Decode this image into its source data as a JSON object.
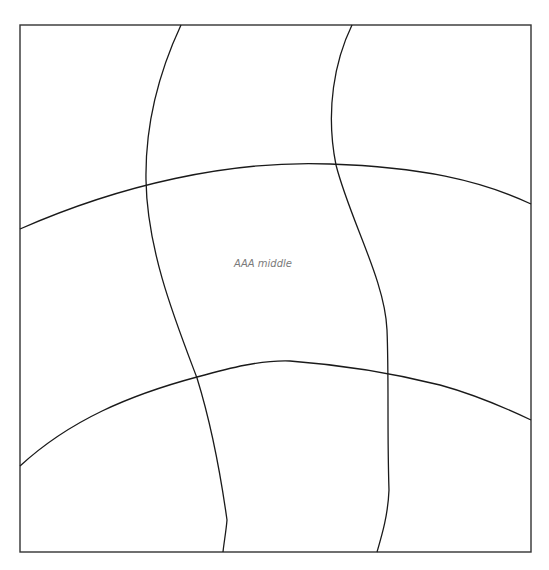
{
  "map": {
    "frame": {
      "x": 20,
      "y": 25,
      "width": 511,
      "height": 527,
      "stroke": "#333333"
    },
    "line_color": "#1a1a1a",
    "graticule": {
      "horizontal": [
        {
          "name": "upper-parallel",
          "path": "M20,229 C120,185 230,160 330,164 C420,167 480,180 531,204"
        },
        {
          "name": "lower-parallel",
          "path": "M20,466 C70,420 130,395 197,377 C230,368 260,360 290,361 C330,364 380,370 440,385 C480,396 510,410 531,420"
        }
      ],
      "vertical": [
        {
          "name": "left-meridian",
          "path": "M181,25 C160,70 145,120 146,180 C147,250 175,320 197,378 C210,420 220,470 227,520 C226,532 224,542 223,552"
        },
        {
          "name": "right-meridian",
          "path": "M352,25 C335,60 325,110 336,165 C350,220 385,280 387,330 C389,380 387,430 389,490 C388,515 382,535 377,552"
        }
      ]
    },
    "labels": [
      {
        "text": "AAA middle",
        "x": 263,
        "y": 267
      }
    ]
  }
}
